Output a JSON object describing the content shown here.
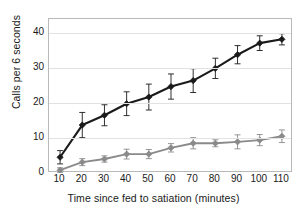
{
  "chart_data": {
    "type": "line",
    "title": "",
    "subtitle": "",
    "xlabel": "Time since fed to satiation (minutes)",
    "ylabel": "Calls per 6 seconds",
    "x": [
      10,
      20,
      30,
      40,
      50,
      60,
      70,
      80,
      90,
      100,
      110
    ],
    "xticklabels": [
      "10",
      "20",
      "30",
      "40",
      "50",
      "60",
      "70",
      "80",
      "90",
      "100",
      "110"
    ],
    "yticklabels": [
      "0",
      "10",
      "20",
      "30",
      "40"
    ],
    "yticks": [
      0,
      10,
      20,
      30,
      40
    ],
    "xlim": [
      5,
      115
    ],
    "ylim": [
      0,
      44
    ],
    "grid": "horizontal",
    "legend": "none",
    "series": [
      {
        "name": "black-series",
        "color": "#1a1a1a",
        "marker": "filled-diamond",
        "values": [
          4.5,
          13.7,
          16.5,
          19.8,
          21.7,
          24.7,
          26.4,
          29.9,
          33.8,
          37.1,
          38.2
        ],
        "errors": [
          1.9,
          3.6,
          3.0,
          3.4,
          3.7,
          3.6,
          3.4,
          2.9,
          2.6,
          2.1,
          1.6
        ]
      },
      {
        "name": "gray-series",
        "color": "#8a8a8a",
        "marker": "filled-diamond",
        "values": [
          0.8,
          3.1,
          4.0,
          5.4,
          5.4,
          7.2,
          8.5,
          8.5,
          8.9,
          9.4,
          10.5
        ],
        "errors": [
          0.7,
          1.0,
          0.9,
          1.4,
          1.3,
          1.2,
          1.6,
          1.0,
          2.0,
          1.6,
          1.8
        ]
      }
    ]
  }
}
